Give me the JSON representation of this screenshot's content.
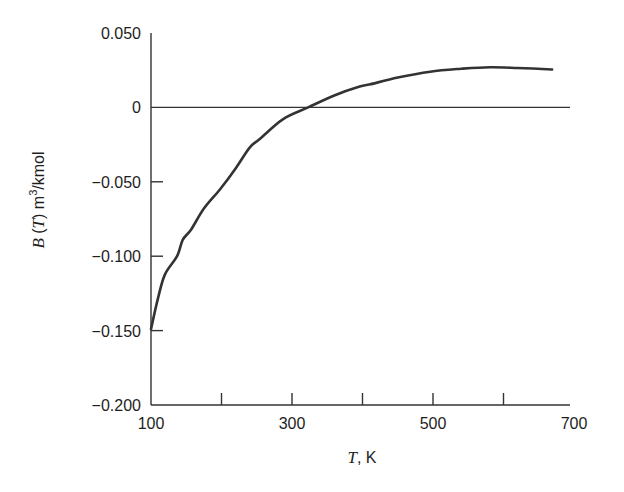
{
  "chart_data": {
    "type": "line",
    "title": "",
    "xlabel": "T, K",
    "ylabel": "B (T) m3/kmol",
    "xlabel_parts": {
      "var": "T",
      "unit": ", K"
    },
    "ylabel_parts": {
      "var": "B",
      "paren_var": "T",
      "unit_base": "m",
      "unit_exp": "3",
      "unit_rest": "/kmol"
    },
    "xlim": [
      100,
      700
    ],
    "ylim": [
      -0.2,
      0.05
    ],
    "x_ticks": [
      100,
      200,
      300,
      400,
      500,
      600,
      700
    ],
    "x_tick_labels": [
      "100",
      "",
      "300",
      "",
      "500",
      "",
      "700"
    ],
    "y_ticks": [
      0.05,
      0,
      -0.05,
      -0.1,
      -0.15,
      -0.2
    ],
    "y_tick_labels": [
      "0.050",
      "0",
      "−0.050",
      "−0.100",
      "−0.150",
      "−0.200"
    ],
    "grid": false,
    "reference_line": {
      "y": 0,
      "label": "zero line"
    },
    "series": [
      {
        "name": "B(T)",
        "color": "#333333",
        "x": [
          100,
          110,
          120,
          137,
          145,
          157,
          175,
          198,
          220,
          240,
          255,
          287,
          323,
          360,
          396,
          411,
          450,
          496,
          540,
          581,
          620,
          669
        ],
        "y": [
          -0.149,
          -0.128,
          -0.112,
          -0.1,
          -0.089,
          -0.082,
          -0.068,
          -0.055,
          -0.041,
          -0.027,
          -0.021,
          -0.008,
          0.0,
          0.008,
          0.014,
          0.0155,
          0.02,
          0.024,
          0.026,
          0.027,
          0.0265,
          0.0255
        ]
      }
    ]
  },
  "plot": {
    "left_px": 151,
    "right_px": 574,
    "top_px": 33,
    "bottom_px": 405,
    "axis_x_end_px": 570,
    "x_axis_label_pos": [
      362,
      463
    ],
    "y_axis_label_pos": [
      44,
      200
    ]
  }
}
